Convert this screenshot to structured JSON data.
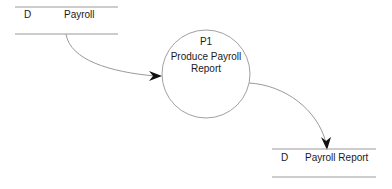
{
  "diagram": {
    "type": "data-flow-diagram",
    "data_stores": [
      {
        "id": "D",
        "name": "Payroll"
      },
      {
        "id": "D",
        "name": "Payroll Report"
      }
    ],
    "processes": [
      {
        "id": "P1",
        "name_line1": "Produce Payroll",
        "name_line2": "Report"
      }
    ],
    "flows": [
      {
        "from": "Payroll",
        "to": "P1"
      },
      {
        "from": "P1",
        "to": "Payroll Report"
      }
    ],
    "colors": {
      "line": "#9a9a9a",
      "arrowhead": "#111111",
      "text": "#1a1a1a"
    }
  }
}
